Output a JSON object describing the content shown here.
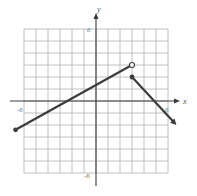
{
  "chart_data": {
    "type": "line",
    "title": "",
    "xlabel": "x",
    "ylabel": "y",
    "xlim": [
      -6,
      6
    ],
    "ylim": [
      -6,
      6
    ],
    "grid": true,
    "grid_step": 1,
    "tick_labels": {
      "x": [
        {
          "value": -6,
          "label": "-6"
        },
        {
          "value": 6,
          "label": "6"
        }
      ],
      "y": [
        {
          "value": 6,
          "label": "6"
        },
        {
          "value": -6,
          "label": "-6"
        }
      ]
    },
    "series": [
      {
        "name": "left-piece",
        "points": [
          [
            -6.7,
            -2.4
          ],
          [
            3,
            3
          ]
        ],
        "start_marker": "closed-dot",
        "end_marker": "open-circle"
      },
      {
        "name": "right-piece",
        "points": [
          [
            3,
            2
          ],
          [
            6.7,
            -2
          ]
        ],
        "start_marker": "closed-dot",
        "end_marker": "arrow"
      }
    ],
    "annotations": [
      "piecewise function with jump discontinuity at x = 3"
    ]
  },
  "labels": {
    "x_axis": "x",
    "y_axis": "y",
    "x_min": "-6",
    "x_max": "6",
    "y_max": "6",
    "y_min": "-6"
  },
  "colors": {
    "grid": "#b9b9b9",
    "axis": "#3a3a3a",
    "line": "#3c3c3c",
    "background": "#ffffff"
  }
}
